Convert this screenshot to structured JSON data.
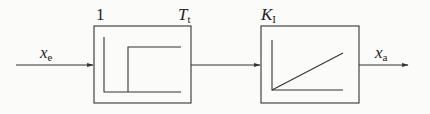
{
  "diagram": {
    "type": "block-diagram",
    "input": {
      "symbol": "x",
      "subscript": "e"
    },
    "output": {
      "symbol": "x",
      "subscript": "a"
    },
    "blocks": [
      {
        "name": "dead-time-element",
        "params": {
          "gain": "1",
          "delay_symbol": "T",
          "delay_subscript": "t"
        },
        "response": "step"
      },
      {
        "name": "integral-element",
        "params": {
          "gain_symbol": "K",
          "gain_subscript": "I"
        },
        "response": "ramp"
      }
    ],
    "colors": {
      "line": "#333333",
      "background": "#fbfbf9"
    }
  }
}
